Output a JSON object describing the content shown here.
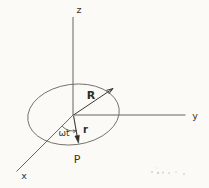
{
  "diagram": {
    "labels": {
      "z_axis": "z",
      "y_axis": "y",
      "x_axis": "x",
      "vector_R": "R",
      "vector_r": "r",
      "angle": "ωt",
      "point_P": "P"
    },
    "colors": {
      "background": "#fbfaf7",
      "axis_line": "#55544e",
      "ellipse_line": "#6b6a63",
      "vector_line": "#3a3934",
      "text": "#33322d",
      "scan_noise": "#d5d4cd"
    }
  }
}
